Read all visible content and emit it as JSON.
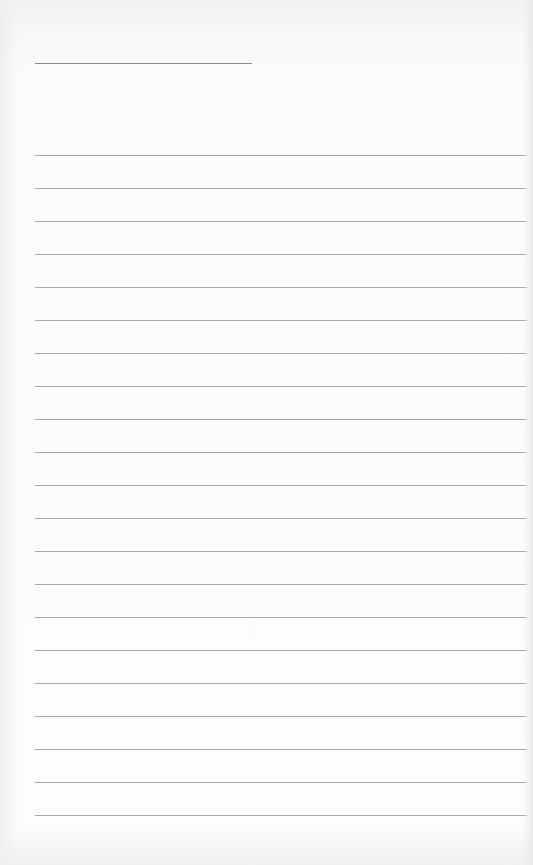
{
  "page": {
    "type": "ruled-notepad-sheet",
    "background_color": "#fbfbfb",
    "line_color": "#9a9a9a",
    "header_line_color": "#8c8c8c"
  },
  "header_line": {
    "left": 35,
    "top": 63,
    "width": 217
  },
  "ruled_lines": {
    "count": 21,
    "left": 35,
    "right": 527,
    "first_top": 155,
    "spacing": 33
  },
  "text_content": []
}
